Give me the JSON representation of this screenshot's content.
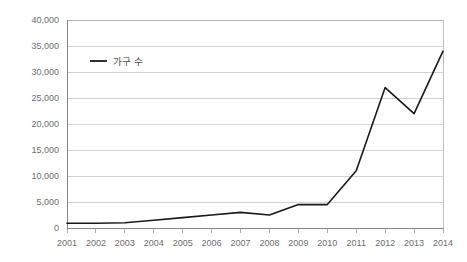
{
  "chart_data": {
    "type": "line",
    "title": "",
    "subtitle": "",
    "xlabel": "",
    "ylabel": "",
    "categories": [
      "2001",
      "2002",
      "2003",
      "2004",
      "2005",
      "2006",
      "2007",
      "2008",
      "2009",
      "2010",
      "2011",
      "2012",
      "2013",
      "2014"
    ],
    "series": [
      {
        "name": "가구 수",
        "values": [
          900,
          900,
          1000,
          1500,
          2000,
          2500,
          3000,
          2500,
          4500,
          4500,
          11000,
          27000,
          22000,
          34000
        ],
        "color": "#1a1a1a"
      }
    ],
    "ylim": [
      0,
      40000
    ],
    "ytick_values": [
      0,
      5000,
      10000,
      15000,
      20000,
      25000,
      30000,
      35000,
      40000
    ],
    "ytick_labels": [
      "0",
      "5,000",
      "10,000",
      "15,000",
      "20,000",
      "25,000",
      "30,000",
      "35,000",
      "40,000"
    ],
    "xtick_labels": [
      "2001",
      "2002",
      "2003",
      "2004",
      "2005",
      "2006",
      "2007",
      "2008",
      "2009",
      "2010",
      "2011",
      "2012",
      "2013",
      "2014"
    ],
    "grid": true,
    "grid_axis": "y",
    "grid_color": "#bfbfbf",
    "legend": {
      "position": "inside-top-left",
      "entries": [
        "가구 수"
      ]
    },
    "background_color": "#ffffff",
    "plot_border_color": "#b0b0b0"
  }
}
